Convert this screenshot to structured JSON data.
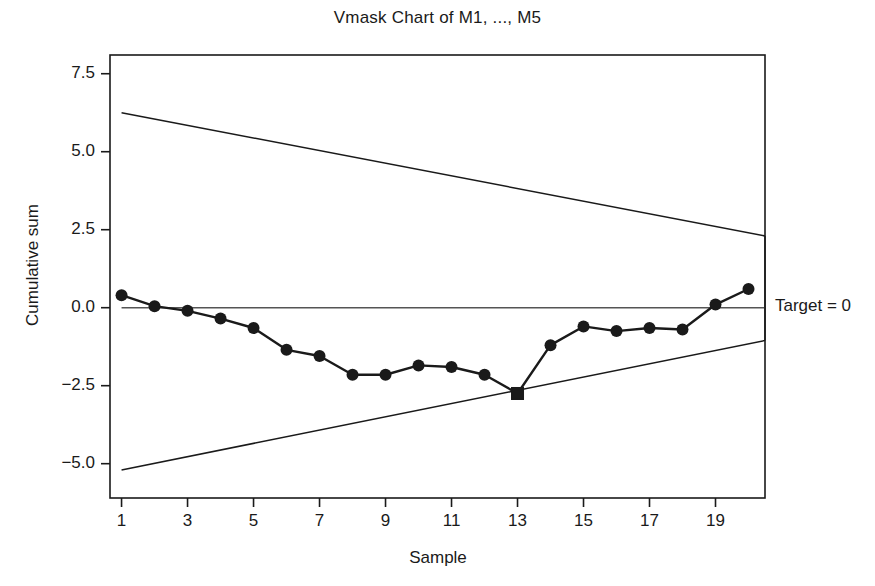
{
  "chart_data": {
    "type": "line",
    "title": "Vmask Chart of M1, ..., M5",
    "xlabel": "Sample",
    "ylabel": "Cumulative sum",
    "x": [
      1,
      2,
      3,
      4,
      5,
      6,
      7,
      8,
      9,
      10,
      11,
      12,
      13,
      14,
      15,
      16,
      17,
      18,
      19,
      20
    ],
    "values": [
      0.4,
      0.05,
      -0.1,
      -0.35,
      -0.65,
      -1.35,
      -1.55,
      -2.15,
      -2.15,
      -1.85,
      -1.9,
      -2.15,
      -2.75,
      -1.2,
      -0.6,
      -0.75,
      -0.65,
      -0.7,
      0.1,
      0.6
    ],
    "xlim": [
      0.65,
      20.5
    ],
    "ylim": [
      -6.1,
      8.1
    ],
    "xticks": [
      1,
      3,
      5,
      7,
      9,
      11,
      13,
      15,
      17,
      19
    ],
    "xtick_labels": [
      "1",
      "3",
      "5",
      "7",
      "9",
      "11",
      "13",
      "15",
      "17",
      "19"
    ],
    "yticks": [
      7.5,
      5.0,
      2.5,
      0.0,
      -2.5,
      -5.0
    ],
    "ytick_labels": [
      "7.5",
      "5.0",
      "2.5",
      "0.0",
      "−2.5",
      "−5.0"
    ],
    "grid": false,
    "legend": false,
    "series_name": "Cumulative sum",
    "marker": "filled-circle",
    "out_of_control_points": [
      {
        "x": 13,
        "y": -2.75,
        "marker": "filled-square"
      }
    ],
    "annotations": [
      {
        "text": "Target = 0",
        "x": 20.9,
        "y": 0.0,
        "name": "target-label"
      }
    ],
    "reference_lines": [
      {
        "name": "target-line",
        "type": "horizontal",
        "y": 0.0,
        "x_start": 1,
        "x_end": 20.5
      }
    ],
    "vmask": {
      "name": "v-mask",
      "apex_x": 20.5,
      "upper_arm": {
        "x_start": 1,
        "y_start": 6.25,
        "x_end": 20.5,
        "y_end": 2.3
      },
      "lower_arm": {
        "x_start": 1,
        "y_start": -5.2,
        "x_end": 20.5,
        "y_end": -1.05
      }
    },
    "colors": {
      "line": "#1a1a1a",
      "marker": "#1a1a1a",
      "vmask": "#1a1a1a",
      "target": "#555555",
      "axis": "#1a1a1a",
      "background": "#ffffff"
    }
  }
}
